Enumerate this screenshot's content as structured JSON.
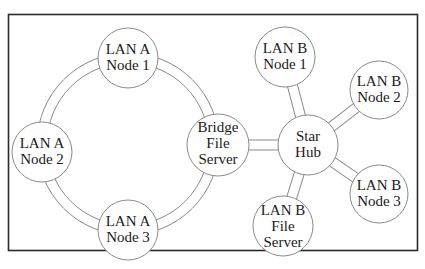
{
  "diagram": {
    "colors": {
      "stroke": "#8a8a8a",
      "frame": "#2a2a2a",
      "text": "#1a1a1a",
      "fill": "#ffffff"
    },
    "nodes": [
      {
        "id": "lan-a-node-1",
        "lines": [
          "LAN A",
          "Node 1"
        ]
      },
      {
        "id": "lan-a-node-2",
        "lines": [
          "LAN A",
          "Node 2"
        ]
      },
      {
        "id": "lan-a-node-3",
        "lines": [
          "LAN A",
          "Node 3"
        ]
      },
      {
        "id": "bridge-file-server",
        "lines": [
          "Bridge",
          "File",
          "Server"
        ]
      },
      {
        "id": "star-hub",
        "lines": [
          "Star",
          "Hub"
        ]
      },
      {
        "id": "lan-b-node-1",
        "lines": [
          "LAN B",
          "Node 1"
        ]
      },
      {
        "id": "lan-b-node-2",
        "lines": [
          "LAN B",
          "Node 2"
        ]
      },
      {
        "id": "lan-b-node-3",
        "lines": [
          "LAN B",
          "Node 3"
        ]
      },
      {
        "id": "lan-b-file-server",
        "lines": [
          "LAN B",
          "File",
          "Server"
        ]
      }
    ],
    "edges": [
      {
        "from": "lan-a-node-1",
        "to": "bridge-file-server",
        "type": "ring"
      },
      {
        "from": "bridge-file-server",
        "to": "lan-a-node-3",
        "type": "ring"
      },
      {
        "from": "lan-a-node-3",
        "to": "lan-a-node-2",
        "type": "ring"
      },
      {
        "from": "lan-a-node-2",
        "to": "lan-a-node-1",
        "type": "ring"
      },
      {
        "from": "bridge-file-server",
        "to": "star-hub",
        "type": "link"
      },
      {
        "from": "star-hub",
        "to": "lan-b-node-1",
        "type": "link"
      },
      {
        "from": "star-hub",
        "to": "lan-b-node-2",
        "type": "link"
      },
      {
        "from": "star-hub",
        "to": "lan-b-node-3",
        "type": "link"
      },
      {
        "from": "star-hub",
        "to": "lan-b-file-server",
        "type": "link"
      }
    ]
  }
}
